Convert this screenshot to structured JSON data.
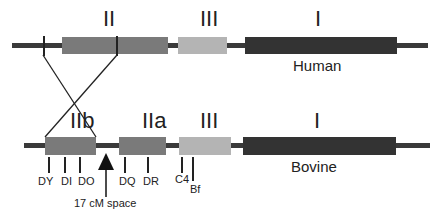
{
  "human": {
    "species": "Human",
    "classes": [
      {
        "label": "II",
        "color": "#7a7a7a"
      },
      {
        "label": "III",
        "color": "#b4b4b4"
      },
      {
        "label": "I",
        "color": "#333333"
      }
    ]
  },
  "bovine": {
    "species": "Bovine",
    "classes": [
      {
        "label": "IIb",
        "color": "#7a7a7a"
      },
      {
        "label": "IIa",
        "color": "#7a7a7a"
      },
      {
        "label": "III",
        "color": "#b4b4b4"
      },
      {
        "label": "I",
        "color": "#333333"
      }
    ],
    "genes": [
      "DY",
      "DI",
      "DO",
      "DQ",
      "DR",
      "C4",
      "Bf"
    ],
    "annotation": "17 cM space"
  },
  "colors": {
    "chromosome_line": "#3a3a3a",
    "class_II": "#7a7a7a",
    "class_III": "#b4b4b4",
    "class_I": "#333333"
  }
}
